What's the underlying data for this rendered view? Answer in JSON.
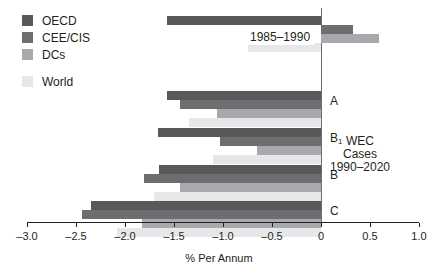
{
  "chart_data": {
    "type": "bar",
    "orientation": "horizontal",
    "title": "",
    "xlabel": "% Per Annum",
    "ylabel": "",
    "xlim": [
      -3.0,
      1.0
    ],
    "xticks": [
      "-3.0",
      "-2.5",
      "-2.0",
      "-1.5",
      "-1.0",
      "-0.5",
      "0",
      "0.5",
      "1.0"
    ],
    "xtick_values": [
      -3.0,
      -2.5,
      -2.0,
      -1.5,
      -1.0,
      -0.5,
      0,
      0.5,
      1.0
    ],
    "grid": false,
    "legend_position": "top-left",
    "legend": [
      "OECD",
      "CEE/CIS",
      "DCs",
      "World"
    ],
    "series": [
      {
        "name": "OECD",
        "color": "#58595b",
        "values": [
          -1.57,
          -1.57,
          -1.66,
          -1.65,
          -2.35
        ]
      },
      {
        "name": "CEE/CIS",
        "color": "#6d6e70",
        "values": [
          0.33,
          -1.44,
          -1.03,
          -1.81,
          -2.44
        ]
      },
      {
        "name": "DCs",
        "color": "#a7a9ac",
        "values": [
          0.59,
          -1.06,
          -0.65,
          -1.44,
          -1.83
        ]
      },
      {
        "name": "World",
        "color": "#e6e7e8",
        "values": [
          -0.75,
          -1.35,
          -1.1,
          -1.7,
          -2.08
        ]
      }
    ],
    "categories": [
      "1985-1990",
      "A",
      "B1",
      "B",
      "C"
    ],
    "annotations": [
      {
        "name": "period-label",
        "text": "1985–1990"
      },
      {
        "name": "wec-note",
        "lines": [
          "WEC",
          "Cases",
          "1990–2020"
        ]
      }
    ]
  },
  "legend": {
    "items": [
      {
        "label": "OECD",
        "swatch_color": "#58595b"
      },
      {
        "label": "CEE/CIS",
        "swatch_color": "#6d6e70"
      },
      {
        "label": "DCs",
        "swatch_color": "#a7a9ac"
      },
      {
        "label": "World",
        "swatch_color": "#e6e7e8"
      }
    ]
  },
  "axis": {
    "ticks": [
      "–3.0",
      "–2.5",
      "–2.0",
      "–1.5",
      "–1.0",
      "–0.5",
      "0",
      "0.5",
      "1.0"
    ],
    "xlabel": "% Per Annum"
  },
  "groups": {
    "period_label": "1985–1990",
    "case_a": "A",
    "case_b1_main": "B",
    "case_b1_sub": "1",
    "case_b": "B",
    "case_c": "C"
  },
  "note": {
    "line1": "WEC",
    "line2": "Cases",
    "line3": "1990–2020"
  }
}
